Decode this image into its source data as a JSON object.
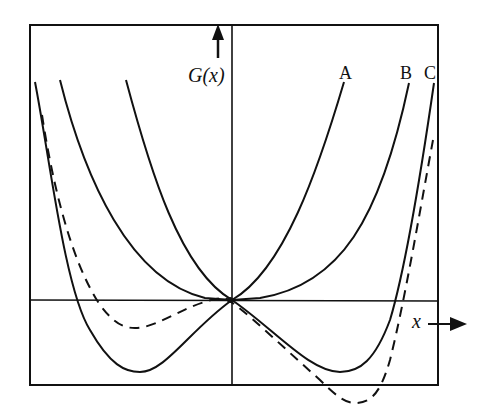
{
  "diagram": {
    "y_axis_label": "G(x)",
    "x_axis_label": "x",
    "curves": [
      {
        "label": "A",
        "style": "solid",
        "description": "single minimum at origin, narrowest parabola-like curve"
      },
      {
        "label": "B",
        "style": "solid",
        "description": "flat single minimum at origin, wider curve"
      },
      {
        "label": "C",
        "style": "solid",
        "description": "double-well curve with two symmetric minima below axis and local maximum at origin"
      },
      {
        "label": "",
        "style": "dashed",
        "description": "asymmetric double-well curve, deeper minimum on right side"
      }
    ],
    "colors": {
      "line": "#111111",
      "background": "#ffffff"
    }
  }
}
